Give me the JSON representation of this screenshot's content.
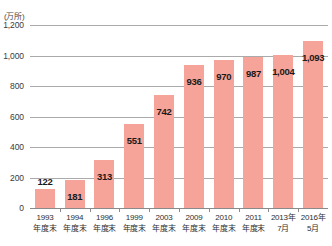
{
  "chart_data": {
    "type": "bar",
    "title": "",
    "subtitle": "",
    "unit_label": "(万所)",
    "xlabel": "",
    "ylabel": "",
    "ylim": [
      0,
      1200
    ],
    "grid": true,
    "legend_position": "none",
    "yticks": [
      "1,200",
      "1,000",
      "800",
      "600",
      "400",
      "200",
      "0"
    ],
    "ytick_values": [
      1200,
      1000,
      800,
      600,
      400,
      200,
      0
    ],
    "categories": [
      {
        "line1": "1993",
        "line2": "年度末"
      },
      {
        "line1": "1994",
        "line2": "年度末"
      },
      {
        "line1": "1996",
        "line2": "年度末"
      },
      {
        "line1": "1999",
        "line2": "年度末"
      },
      {
        "line1": "2003",
        "line2": "年度末"
      },
      {
        "line1": "2009",
        "line2": "年度末"
      },
      {
        "line1": "2010",
        "line2": "年度末"
      },
      {
        "line1": "2011",
        "line2": "年度末"
      },
      {
        "line1": "2013年",
        "line2": "7月"
      },
      {
        "line1": "2016年",
        "line2": "5月"
      }
    ],
    "values": [
      122,
      181,
      313,
      551,
      742,
      936,
      970,
      987,
      1004,
      1093
    ],
    "value_labels": [
      "122",
      "181",
      "313",
      "551",
      "742",
      "936",
      "970",
      "987",
      "1,004",
      "1,093"
    ],
    "colors": {
      "bar": "#f6a399",
      "gridline": "#aaaaaa",
      "axis": "#8a8a8a",
      "label_text": "#1a1a1a",
      "tick_text": "#3a3a3a",
      "background": "#ffffff"
    }
  }
}
